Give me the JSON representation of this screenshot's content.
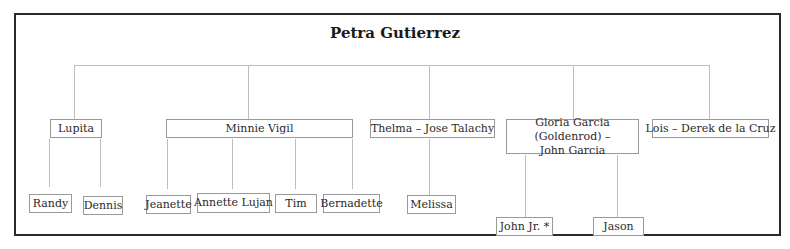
{
  "diagram": {
    "type": "family-tree",
    "root": {
      "name": "Petra Gutierrez"
    },
    "children": [
      {
        "name": "Lupita",
        "children": [
          {
            "name": "Randy"
          },
          {
            "name": "Dennis"
          }
        ]
      },
      {
        "name": "Minnie Vigil",
        "children": [
          {
            "name": "Jeanette"
          },
          {
            "name": "Annette Lujan"
          },
          {
            "name": "Tim"
          },
          {
            "name": "Bernadette"
          }
        ]
      },
      {
        "name": "Thelma – Jose Talachy",
        "children": [
          {
            "name": "Melissa"
          }
        ]
      },
      {
        "name_line1": "Gloria Garcia (Goldenrod) –",
        "name_line2": "John Garcia",
        "children": [
          {
            "name": "John Jr. *"
          },
          {
            "name": "Jason"
          }
        ]
      },
      {
        "name": "Lois – Derek de la Cruz",
        "children": []
      }
    ]
  }
}
